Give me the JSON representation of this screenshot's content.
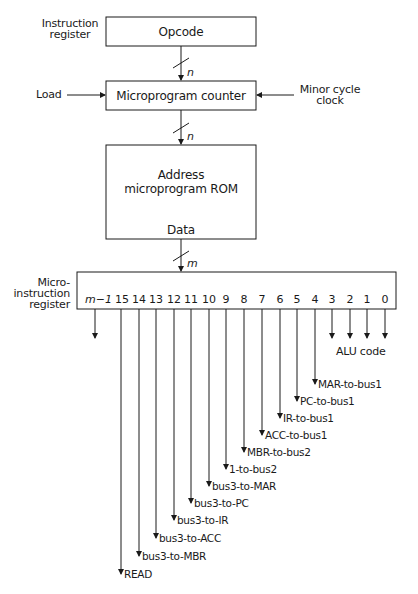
{
  "diagram": {
    "blocks": {
      "opcode": "Opcode",
      "counter": "Microprogram counter",
      "rom_line1": "Address",
      "rom_line2": "microprogram ROM",
      "rom_data": "Data"
    },
    "inputs": {
      "ir_line1": "Instruction",
      "ir_line2": "register",
      "load": "Load",
      "clock_line1": "Minor cycle",
      "clock_line2": "clock"
    },
    "bus_widths": {
      "opcode_to_counter": "n",
      "counter_to_rom": "n",
      "rom_to_register": "m"
    },
    "register": {
      "label_line1": "Micro-",
      "label_line2": "instruction",
      "label_line3": "register",
      "bits": [
        "m−1",
        "15",
        "14",
        "13",
        "12",
        "11",
        "10",
        "9",
        "8",
        "7",
        "6",
        "5",
        "4",
        "3",
        "2",
        "1",
        "0"
      ]
    },
    "alu_code_label": "ALU code",
    "signals": [
      {
        "bit": "15",
        "name": "READ"
      },
      {
        "bit": "14",
        "name": "bus3-to-MBR"
      },
      {
        "bit": "13",
        "name": "bus3-to-ACC"
      },
      {
        "bit": "12",
        "name": "bus3-to-IR"
      },
      {
        "bit": "11",
        "name": "bus3-to-PC"
      },
      {
        "bit": "10",
        "name": "bus3-to-MAR"
      },
      {
        "bit": "9",
        "name": "1-to-bus2"
      },
      {
        "bit": "8",
        "name": "MBR-to-bus2"
      },
      {
        "bit": "7",
        "name": "ACC-to-bus1"
      },
      {
        "bit": "6",
        "name": "IR-to-bus1"
      },
      {
        "bit": "5",
        "name": "PC-to-bus1"
      },
      {
        "bit": "4",
        "name": "MAR-to-bus1"
      }
    ]
  }
}
